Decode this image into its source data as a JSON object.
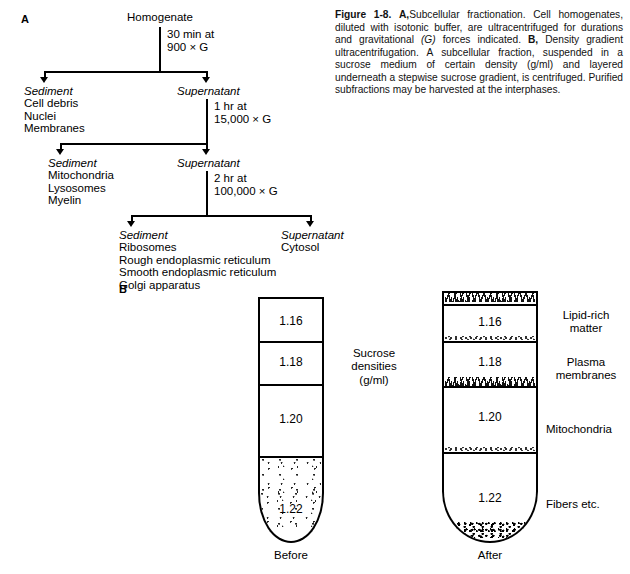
{
  "panels": {
    "a_letter": "A",
    "b_letter": "B"
  },
  "flowchart": {
    "root": "Homogenate",
    "spins": [
      {
        "duration": "30 min at",
        "force": "900 × G"
      },
      {
        "duration": "1 hr at",
        "force": "15,000 × G"
      },
      {
        "duration": "2 hr at",
        "force": "100,000 × G"
      }
    ],
    "fractions": [
      {
        "heading": "Sediment",
        "contents": [
          "Cell debris",
          "Nuclei",
          "Membranes"
        ]
      },
      {
        "heading": "Supernatant",
        "contents": []
      },
      {
        "heading": "Sediment",
        "contents": [
          "Mitochondria",
          "Lysosomes",
          "Myelin"
        ]
      },
      {
        "heading": "Supernatant",
        "contents": []
      },
      {
        "heading": "Sediment",
        "contents": [
          "Ribosomes",
          "Rough endoplasmic reticulum",
          "Smooth endoplasmic reticulum",
          "Golgi apparatus"
        ]
      },
      {
        "heading": "Supernatant",
        "contents": [
          "Cytosol"
        ]
      }
    ]
  },
  "caption": {
    "figure_number": "Figure 1-8.",
    "part_a_label": "A,",
    "part_a_text_1": "Subcellular fractionation. Cell homogenates, diluted with isotonic buffer, are ultracentrifuged for durations and gravitational ",
    "part_a_italic": "(G)",
    "part_a_text_2": " forces indicated. ",
    "part_b_label": "B,",
    "part_b_text": " Density gradient ultracentrifugation. A subcellular fraction, suspended in a sucrose medium of certain density (g/ml) and layered underneath a stepwise sucrose gradient, is centrifuged. Purified subfractions may be harvested at the interphases."
  },
  "gradient": {
    "axis_note": [
      "Sucrose",
      "densities",
      "(g/ml)"
    ],
    "densities": [
      "1.16",
      "1.18",
      "1.20",
      "1.22"
    ],
    "tubes": [
      {
        "caption": "Before",
        "name": "before-tube"
      },
      {
        "caption": "After",
        "name": "after-tube"
      }
    ],
    "fraction_labels": [
      {
        "line1": "Lipid-rich",
        "line2": "matter"
      },
      {
        "line1": "Plasma",
        "line2": "membranes"
      },
      {
        "line1": "Mitochondria",
        "line2": ""
      },
      {
        "line1": "Fibers etc.",
        "line2": ""
      }
    ]
  },
  "colors": {
    "ink": "#000000",
    "paper": "#ffffff",
    "caption_ink": "#111111"
  }
}
